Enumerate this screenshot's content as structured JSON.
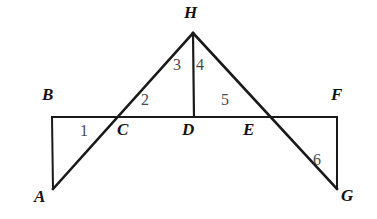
{
  "figure": {
    "background_color": "#ffffff",
    "stroke_color": "#1a1a1a",
    "vertex_label_color": "#121212",
    "angle_label_color": "#4a4a4a",
    "canvas": {
      "width": 377,
      "height": 219
    }
  },
  "points": {
    "A": {
      "label": "A",
      "x": 53,
      "y": 189,
      "label_x": 34,
      "label_y": 188
    },
    "B": {
      "label": "B",
      "x": 52,
      "y": 117,
      "label_x": 42,
      "label_y": 86
    },
    "C": {
      "label": "C",
      "x": 119,
      "y": 117,
      "label_x": 117,
      "label_y": 121
    },
    "D": {
      "label": "D",
      "x": 194,
      "y": 117,
      "label_x": 182,
      "label_y": 121
    },
    "E": {
      "label": "E",
      "x": 268,
      "y": 117,
      "label_x": 243,
      "label_y": 121
    },
    "F": {
      "label": "F",
      "x": 337,
      "y": 117,
      "label_x": 331,
      "label_y": 86
    },
    "G": {
      "label": "G",
      "x": 337,
      "y": 189,
      "label_x": 341,
      "label_y": 187
    },
    "H": {
      "label": "H",
      "x": 193,
      "y": 33,
      "label_x": 184,
      "label_y": 4
    }
  },
  "segments": [
    {
      "name": "segment-BF",
      "from": "B",
      "to": "F",
      "width": 2
    },
    {
      "name": "segment-BA",
      "from": "B",
      "to": "A",
      "width": 2
    },
    {
      "name": "segment-FG",
      "from": "F",
      "to": "G",
      "width": 2
    },
    {
      "name": "segment-AH",
      "from": "A",
      "to": "H",
      "width": 2.6
    },
    {
      "name": "segment-HG",
      "from": "H",
      "to": "G",
      "width": 2.6
    },
    {
      "name": "segment-HD",
      "from": "H",
      "to": "D",
      "width": 2.2
    }
  ],
  "angles": [
    {
      "id": "1",
      "label": "1",
      "x": 80,
      "y": 123,
      "at_vertex": "C"
    },
    {
      "id": "2",
      "label": "2",
      "x": 141,
      "y": 92,
      "at_vertex": "C"
    },
    {
      "id": "3",
      "label": "3",
      "x": 173,
      "y": 57,
      "at_vertex": "H"
    },
    {
      "id": "4",
      "label": "4",
      "x": 196,
      "y": 57,
      "at_vertex": "H"
    },
    {
      "id": "5",
      "label": "5",
      "x": 221,
      "y": 92,
      "at_vertex": "E"
    },
    {
      "id": "6",
      "label": "6",
      "x": 313,
      "y": 152,
      "at_vertex": "E"
    }
  ]
}
